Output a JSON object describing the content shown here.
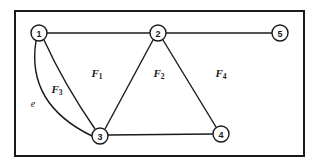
{
  "figure": {
    "background_color": "#ffffff",
    "stroke_color": "#1a1a1a",
    "frame": {
      "x": 14,
      "y": 10,
      "width": 291,
      "height": 147,
      "stroke_width": 2
    }
  },
  "nodes": [
    {
      "id": "1",
      "label": "1",
      "cx": 39,
      "cy": 33,
      "r": 8
    },
    {
      "id": "2",
      "label": "2",
      "cx": 158,
      "cy": 33,
      "r": 8
    },
    {
      "id": "3",
      "label": "3",
      "cx": 100,
      "cy": 136,
      "r": 8
    },
    {
      "id": "4",
      "label": "4",
      "cx": 221,
      "cy": 134,
      "r": 8
    },
    {
      "id": "5",
      "label": "5",
      "cx": 280,
      "cy": 33,
      "r": 8
    }
  ],
  "edges": [
    {
      "id": "edge-1-2",
      "from": "1",
      "to": "2",
      "kind": "straight"
    },
    {
      "id": "edge-2-5",
      "from": "2",
      "to": "5",
      "kind": "straight"
    },
    {
      "id": "edge-1-3-inner",
      "from": "1",
      "to": "3",
      "kind": "curved"
    },
    {
      "id": "edge-1-3-outer",
      "from": "1",
      "to": "3",
      "kind": "curved",
      "label": "e"
    },
    {
      "id": "edge-2-3",
      "from": "2",
      "to": "3",
      "kind": "straight"
    },
    {
      "id": "edge-2-4",
      "from": "2",
      "to": "4",
      "kind": "straight"
    },
    {
      "id": "edge-3-4",
      "from": "3",
      "to": "4",
      "kind": "straight"
    }
  ],
  "face_labels": [
    {
      "id": "F1",
      "base": "F",
      "sub": "1",
      "x": 97,
      "y": 73
    },
    {
      "id": "F2",
      "base": "F",
      "sub": "2",
      "x": 159,
      "y": 73
    },
    {
      "id": "F3",
      "base": "F",
      "sub": "3",
      "x": 57,
      "y": 89
    },
    {
      "id": "F4",
      "base": "F",
      "sub": "4",
      "x": 221,
      "y": 73
    }
  ],
  "edge_labels": [
    {
      "id": "e",
      "text": "e",
      "x": 33,
      "y": 103
    }
  ]
}
